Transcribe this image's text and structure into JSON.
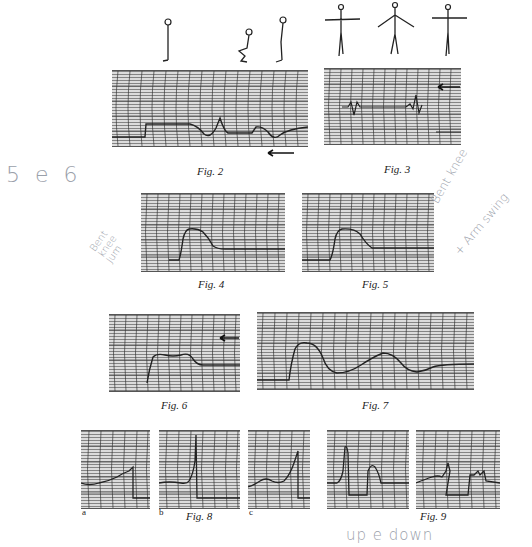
{
  "figures": [
    {
      "id": "fig2",
      "caption": "Fig. 2",
      "subject": "standing-squat-standing",
      "arrow_direction": "left"
    },
    {
      "id": "fig3",
      "caption": "Fig. 3",
      "subject": "arms-out-raised-out",
      "arrow_direction": "left"
    },
    {
      "id": "fig4",
      "caption": "Fig. 4"
    },
    {
      "id": "fig5",
      "caption": "Fig. 5"
    },
    {
      "id": "fig6",
      "caption": "Fig. 6",
      "arrow_direction": "left"
    },
    {
      "id": "fig7",
      "caption": "Fig. 7"
    },
    {
      "id": "fig8",
      "caption": "Fig. 8",
      "sublabels": [
        "a",
        "b",
        "c"
      ]
    },
    {
      "id": "fig9",
      "caption": "Fig. 9"
    }
  ],
  "annotations": {
    "left_margin": "5 e 6",
    "fig4_note": "Bent knee Jum",
    "fig5_note_line1": "Bent knee",
    "fig5_note_line2": "+ Arm swing",
    "fig9_note": "up e down"
  },
  "colors": {
    "paper": "#ffffff",
    "grid": "#dcdcdc",
    "trace": "#2a2a2a",
    "handwriting": "#9aa0aa"
  }
}
